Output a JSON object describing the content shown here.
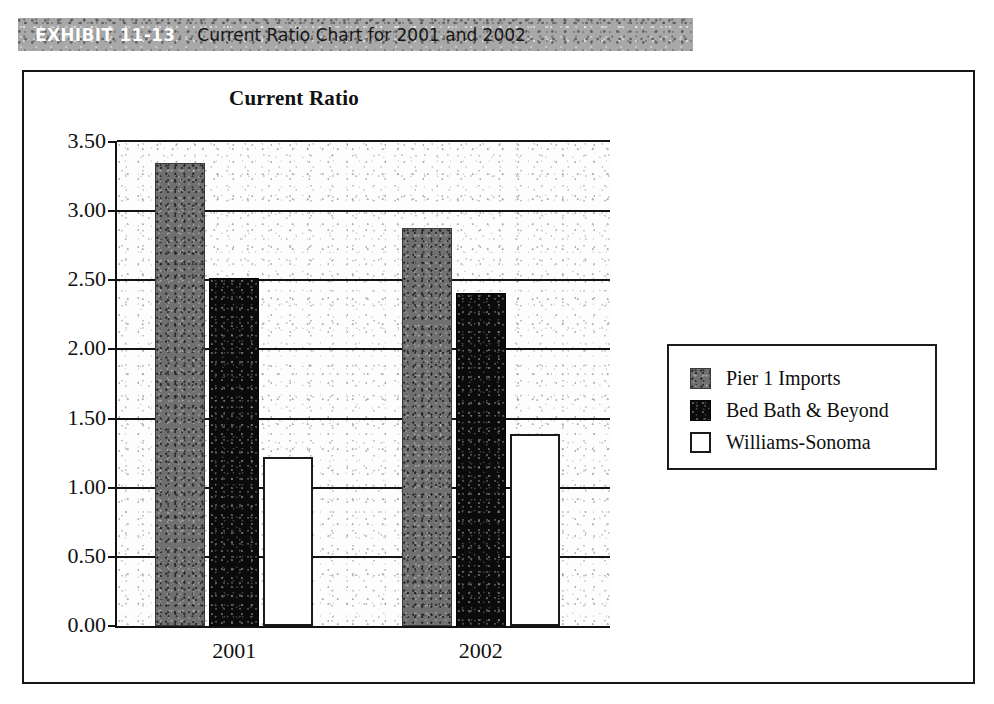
{
  "exhibit": {
    "number": "EXHIBIT 11-13",
    "title": "Current Ratio Chart for 2001 and 2002"
  },
  "chart_data": {
    "type": "bar",
    "title": "Current Ratio",
    "xlabel": "",
    "ylabel": "",
    "categories": [
      "2001",
      "2002"
    ],
    "series": [
      {
        "name": "Pier 1 Imports",
        "values": [
          3.35,
          2.88
        ],
        "color": "#707070"
      },
      {
        "name": "Bed Bath & Beyond",
        "values": [
          2.52,
          2.41
        ],
        "color": "#0b0b0b"
      },
      {
        "name": "Williams-Sonoma",
        "values": [
          1.22,
          1.39
        ],
        "color": "#ffffff"
      }
    ],
    "ylim": [
      0.0,
      3.5
    ],
    "ytick_labels": [
      "3.50",
      "3.00",
      "2.50",
      "2.00",
      "1.50",
      "1.00",
      "0.50",
      "0.00"
    ],
    "ytick_values": [
      3.5,
      3.0,
      2.5,
      2.0,
      1.5,
      1.0,
      0.5,
      0.0
    ],
    "grid": true,
    "legend_position": "right"
  }
}
